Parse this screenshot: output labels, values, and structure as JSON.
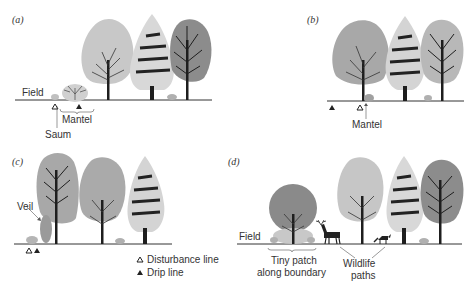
{
  "panels": [
    {
      "id": "a",
      "label": "(a)",
      "annotations": {
        "field": "Field",
        "saum": "Saum",
        "mantel": "Mantel"
      }
    },
    {
      "id": "b",
      "label": "(b)",
      "annotations": {
        "mantel": "Mantel"
      }
    },
    {
      "id": "c",
      "label": "(c)",
      "annotations": {
        "veil": "Veil"
      }
    },
    {
      "id": "d",
      "label": "(d)",
      "annotations": {
        "field": "Field",
        "patch_line1": "Tiny patch",
        "patch_line2": "along boundary",
        "wildlife_line1": "Wildlife",
        "wildlife_line2": "paths"
      }
    }
  ],
  "legend": {
    "items": [
      {
        "symbol": "open-triangle",
        "label": "Disturbance line"
      },
      {
        "symbol": "filled-triangle",
        "label": "Drip line"
      }
    ]
  },
  "colors": {
    "light_foliage": "#c9c9c9",
    "mid_foliage": "#a9a9a9",
    "dark_foliage": "#8c8c8c",
    "conifer_foliage": "#d8d8d8",
    "trunk": "#1e1e1e",
    "ground": "#333333"
  }
}
